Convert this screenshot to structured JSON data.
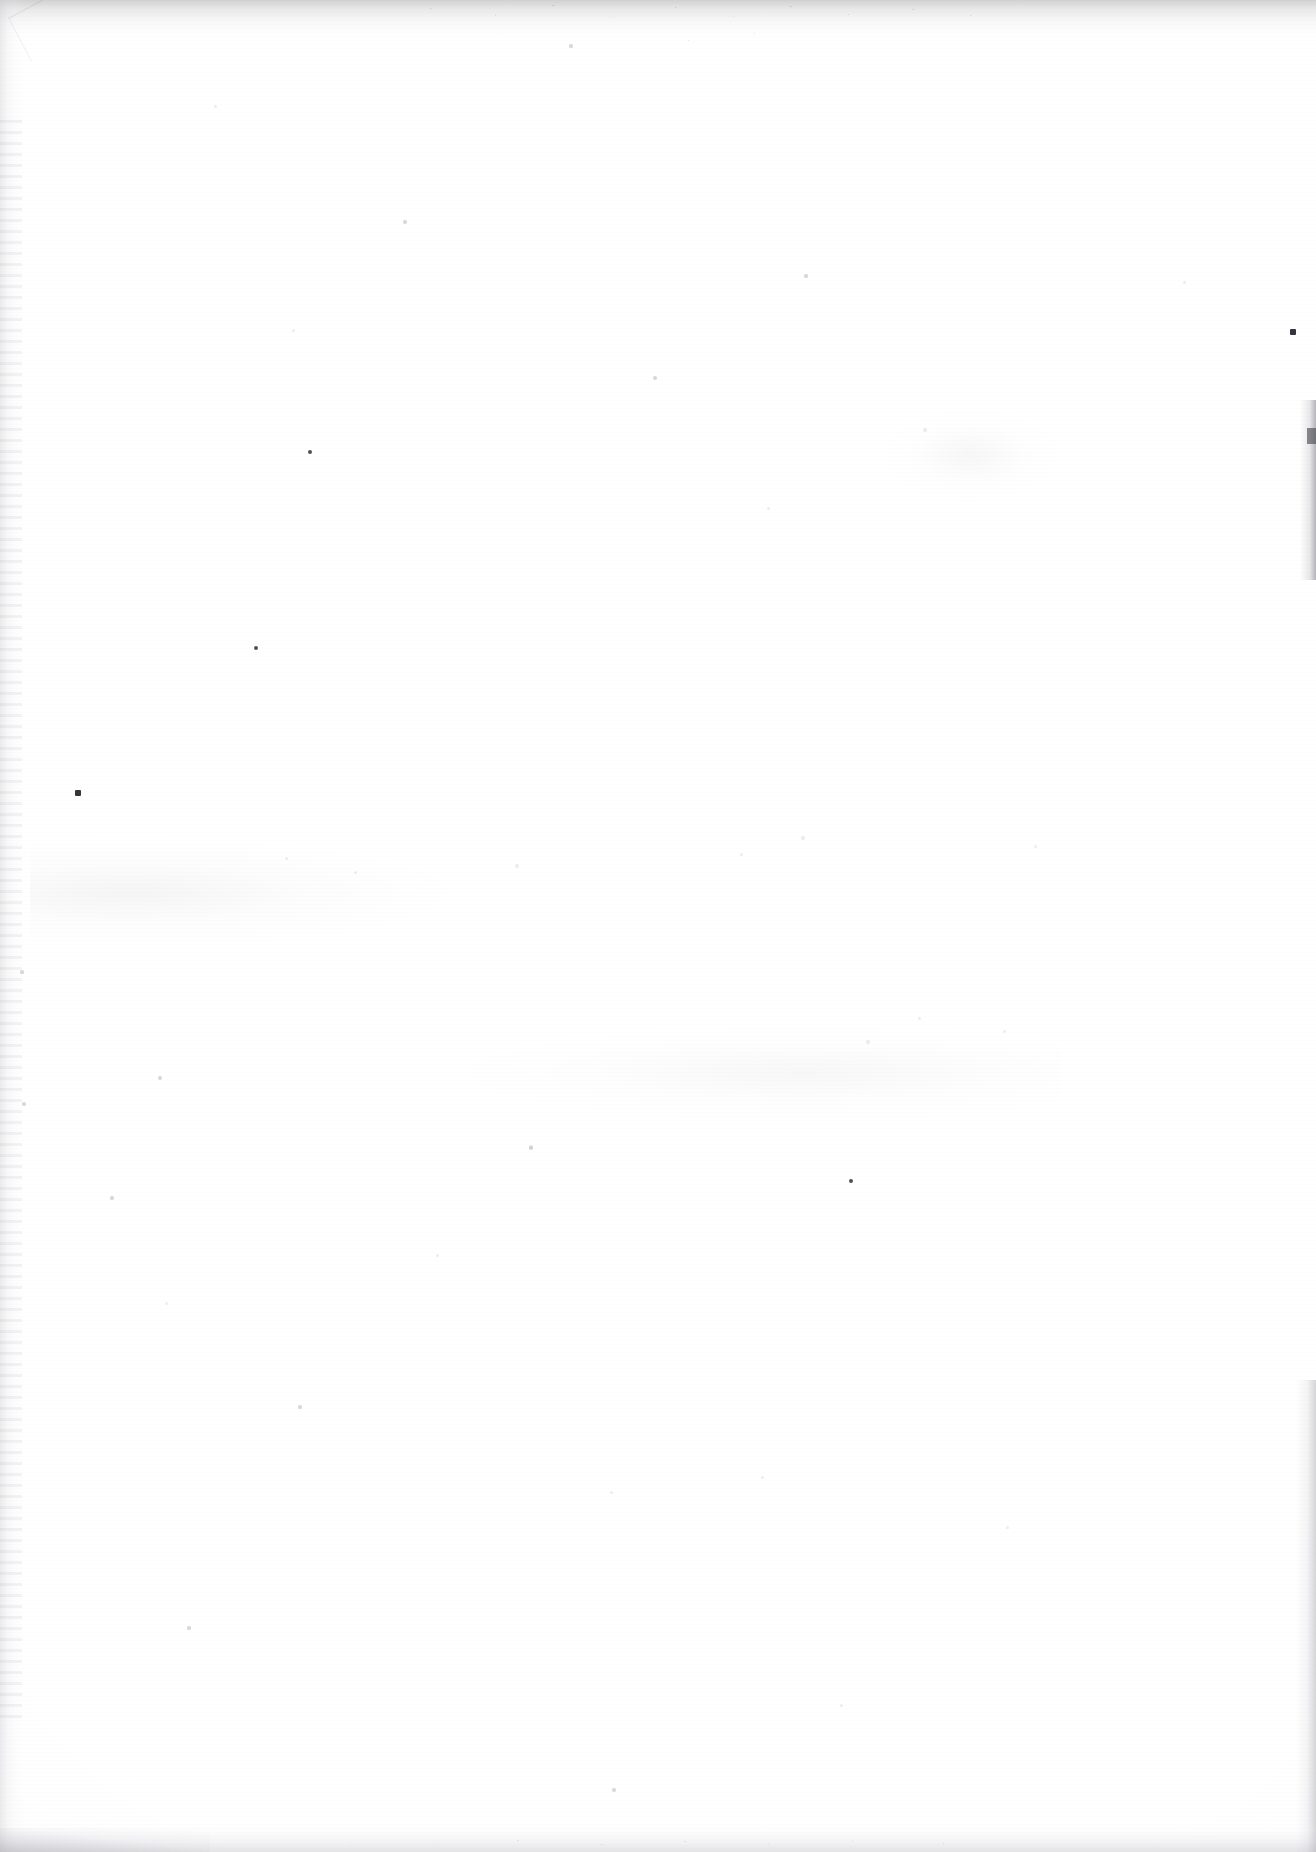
{
  "page": {
    "kind": "scanned-document-page",
    "content_state": "blank",
    "width": 1316,
    "height": 1852,
    "description": "Blank scanned page. No text, headings, figures, tables, page numbers or any printed content are visible anywhere on the page.",
    "visible_text": "",
    "paper_color": "#fdfdfd",
    "background_color": "#ffffff"
  },
  "artifacts": {
    "top_edge": {
      "name": "top-edge-shadow",
      "note": "Darker mottled grey band with fine speckle along the very top of the scan.",
      "color": "#78787d"
    },
    "left_edge": {
      "name": "left-gutter-shadow",
      "note": "Faint vertical gradient along the left margin from the binding gutter.",
      "color": "#cdcdd2"
    },
    "right_edge": {
      "name": "right-page-curl-shadow",
      "note": "Soft shadow strips on the right margin from page curl, strongest near the upper and lower thirds.",
      "color": "#9696a0"
    },
    "bottom_edge": {
      "name": "bottom-edge-shadow",
      "note": "Grey mottled band with speckle along the bottom of the scan.",
      "color": "#afafb6"
    },
    "dust": {
      "name": "dust-specks",
      "note": "Scattered dust and sensor specks across the otherwise empty paper field.",
      "count": 38,
      "color": "#3c3c44"
    }
  },
  "specks": [
    {
      "x": 310,
      "y": 452,
      "r": 2.4,
      "class": "dark"
    },
    {
      "x": 256,
      "y": 648,
      "r": 2.2,
      "class": "dark"
    },
    {
      "x": 78,
      "y": 793,
      "r": 2.8,
      "class": "ink"
    },
    {
      "x": 1293,
      "y": 332,
      "r": 2.6,
      "class": "ink"
    },
    {
      "x": 851,
      "y": 1181,
      "r": 2.3,
      "class": "dark"
    },
    {
      "x": 531,
      "y": 1148,
      "r": 1.9,
      "class": "faint"
    },
    {
      "x": 655,
      "y": 378,
      "r": 1.8,
      "class": "faint"
    },
    {
      "x": 405,
      "y": 222,
      "r": 1.7,
      "class": "faint"
    },
    {
      "x": 806,
      "y": 276,
      "r": 1.6,
      "class": "faint"
    },
    {
      "x": 293,
      "y": 330,
      "r": 1.5,
      "class": "vfaint"
    },
    {
      "x": 215,
      "y": 106,
      "r": 1.5,
      "class": "vfaint"
    },
    {
      "x": 571,
      "y": 46,
      "r": 1.6,
      "class": "faint"
    },
    {
      "x": 768,
      "y": 508,
      "r": 1.5,
      "class": "vfaint"
    },
    {
      "x": 925,
      "y": 430,
      "r": 1.6,
      "class": "vfaint"
    },
    {
      "x": 1184,
      "y": 282,
      "r": 1.5,
      "class": "vfaint"
    },
    {
      "x": 22,
      "y": 972,
      "r": 1.6,
      "class": "faint"
    },
    {
      "x": 160,
      "y": 1078,
      "r": 1.7,
      "class": "faint"
    },
    {
      "x": 24,
      "y": 1104,
      "r": 1.8,
      "class": "faint"
    },
    {
      "x": 286,
      "y": 858,
      "r": 1.5,
      "class": "vfaint"
    },
    {
      "x": 355,
      "y": 872,
      "r": 1.5,
      "class": "vfaint"
    },
    {
      "x": 517,
      "y": 866,
      "r": 1.6,
      "class": "vfaint"
    },
    {
      "x": 741,
      "y": 854,
      "r": 1.5,
      "class": "vfaint"
    },
    {
      "x": 803,
      "y": 838,
      "r": 1.6,
      "class": "vfaint"
    },
    {
      "x": 1035,
      "y": 846,
      "r": 1.5,
      "class": "vfaint"
    },
    {
      "x": 868,
      "y": 1042,
      "r": 1.6,
      "class": "vfaint"
    },
    {
      "x": 919,
      "y": 1018,
      "r": 1.5,
      "class": "vfaint"
    },
    {
      "x": 1004,
      "y": 1031,
      "r": 1.5,
      "class": "vfaint"
    },
    {
      "x": 531,
      "y": 1147,
      "r": 1.6,
      "class": "vfaint"
    },
    {
      "x": 437,
      "y": 1255,
      "r": 1.5,
      "class": "vfaint"
    },
    {
      "x": 112,
      "y": 1198,
      "r": 1.6,
      "class": "faint"
    },
    {
      "x": 166,
      "y": 1303,
      "r": 1.5,
      "class": "vfaint"
    },
    {
      "x": 300,
      "y": 1407,
      "r": 1.6,
      "class": "faint"
    },
    {
      "x": 611,
      "y": 1492,
      "r": 1.5,
      "class": "vfaint"
    },
    {
      "x": 762,
      "y": 1477,
      "r": 1.5,
      "class": "vfaint"
    },
    {
      "x": 1007,
      "y": 1527,
      "r": 1.5,
      "class": "vfaint"
    },
    {
      "x": 189,
      "y": 1628,
      "r": 1.6,
      "class": "faint"
    },
    {
      "x": 841,
      "y": 1705,
      "r": 1.5,
      "class": "vfaint"
    },
    {
      "x": 614,
      "y": 1790,
      "r": 1.7,
      "class": "faint"
    }
  ]
}
